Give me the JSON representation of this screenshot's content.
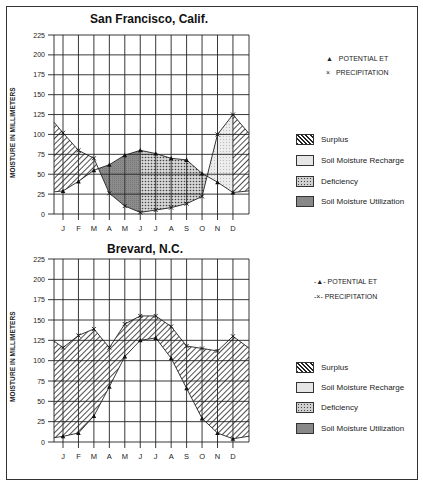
{
  "chart_data": [
    {
      "type": "line",
      "title": "San Francisco, Calif.",
      "xlabel": "",
      "ylabel": "MOISTURE IN MILLIMETERS",
      "categories": [
        "J",
        "F",
        "M",
        "A",
        "M",
        "J",
        "J",
        "A",
        "S",
        "O",
        "N",
        "D"
      ],
      "yticks": [
        0,
        25,
        50,
        75,
        100,
        125,
        150,
        175,
        200,
        225
      ],
      "ylim": [
        0,
        225
      ],
      "grid": true,
      "series": [
        {
          "name": "POTENTIAL ET",
          "marker": "triangle",
          "values": [
            29,
            41,
            55,
            62,
            74,
            80,
            76,
            70,
            68,
            51,
            40,
            27
          ]
        },
        {
          "name": "PRECIPITATION",
          "marker": "x",
          "values": [
            102,
            80,
            70,
            26,
            10,
            2,
            5,
            8,
            13,
            22,
            100,
            125
          ]
        }
      ],
      "legend": [
        {
          "label": "Surplus",
          "pattern": "diagonal-hatch"
        },
        {
          "label": "Soil Moisture Recharge",
          "pattern": "light-stipple"
        },
        {
          "label": "Deficiency",
          "pattern": "dot-stipple"
        },
        {
          "label": "Soil Moisture Utilization",
          "pattern": "dark-gray"
        }
      ]
    },
    {
      "type": "line",
      "title": "Brevard, N.C.",
      "xlabel": "",
      "ylabel": "MOISTURE IN MILLIMETERS",
      "categories": [
        "J",
        "F",
        "M",
        "A",
        "M",
        "J",
        "J",
        "A",
        "S",
        "O",
        "N",
        "D"
      ],
      "yticks": [
        0,
        25,
        50,
        75,
        100,
        125,
        150,
        175,
        200,
        225
      ],
      "ylim": [
        0,
        225
      ],
      "grid": true,
      "series": [
        {
          "name": "POTENTIAL ET",
          "marker": "triangle",
          "values": [
            7,
            11,
            32,
            68,
            105,
            125,
            128,
            103,
            66,
            29,
            11,
            4
          ]
        },
        {
          "name": "PRECIPITATION",
          "marker": "x",
          "values": [
            116,
            131,
            139,
            116,
            145,
            155,
            155,
            142,
            118,
            115,
            112,
            130
          ]
        }
      ],
      "legend": [
        {
          "label": "Surplus",
          "pattern": "diagonal-hatch"
        },
        {
          "label": "Soil Moisture Recharge",
          "pattern": "light-stipple"
        },
        {
          "label": "Deficiency",
          "pattern": "dot-stipple"
        },
        {
          "label": "Soil Moisture Utilization",
          "pattern": "dark-gray"
        }
      ]
    }
  ],
  "charts": {
    "top": {
      "title": "San Francisco, Calif.",
      "ylabel": "MOISTURE IN MILLIMETERS",
      "legend_pet": "POTENTIAL ET",
      "legend_precip": "PRECIPITATION",
      "legend_surplus": "Surplus",
      "legend_recharge": "Soil Moisture Recharge",
      "legend_deficiency": "Deficiency",
      "legend_utilization": "Soil Moisture Utilization"
    },
    "bottom": {
      "title": "Brevard, N.C.",
      "ylabel": "MOISTURE IN MILLIMETERS",
      "legend_pet": "POTENTIAL ET",
      "legend_precip": "PRECIPITATION",
      "legend_surplus": "Surplus",
      "legend_recharge": "Soil Moisture Recharge",
      "legend_deficiency": "Deficiency",
      "legend_utilization": "Soil Moisture Utilization"
    }
  },
  "colors": {
    "grid": "#222222",
    "utilization": "#8a8a8a",
    "deficiency_bg": "#c8c8c8",
    "recharge_bg": "#e4e4e4",
    "hatch": "#222222"
  }
}
